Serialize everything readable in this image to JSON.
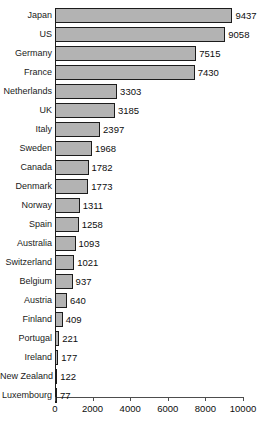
{
  "chart_data": {
    "type": "bar",
    "orientation": "horizontal",
    "title": "",
    "subtitle": "",
    "xlabel": "",
    "ylabel": "",
    "xlim": [
      0,
      10000
    ],
    "xticks": [
      0,
      2000,
      4000,
      6000,
      8000,
      10000
    ],
    "xtick_labels": [
      "0",
      "2000",
      "4000",
      "6000",
      "8000",
      "10000"
    ],
    "grid": false,
    "legend": false,
    "bar_color": "#b3b3b3",
    "bar_border_color": "#1c1c1c",
    "background": "#ffffff",
    "categories": [
      "Japan",
      "US",
      "Germany",
      "France",
      "Netherlands",
      "UK",
      "Italy",
      "Sweden",
      "Canada",
      "Denmark",
      "Norway",
      "Spain",
      "Australia",
      "Switzerland",
      "Belgium",
      "Austria",
      "Finland",
      "Portugal",
      "Ireland",
      "New Zealand",
      "Luxembourg"
    ],
    "values": [
      9437,
      9058,
      7515,
      7430,
      3303,
      3185,
      2397,
      1968,
      1782,
      1773,
      1311,
      1258,
      1093,
      1021,
      937,
      640,
      409,
      221,
      177,
      122,
      77
    ],
    "value_labels": [
      "9437",
      "9058",
      "7515",
      "7430",
      "3303",
      "3185",
      "2397",
      "1968",
      "1782",
      "1773",
      "1311",
      "1258",
      "1093",
      "1021",
      "937",
      "640",
      "409",
      "221",
      "177",
      "122",
      "77"
    ]
  }
}
